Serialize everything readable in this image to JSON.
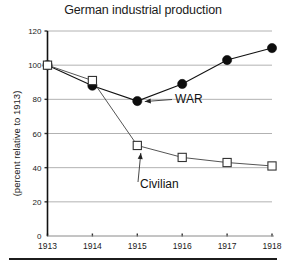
{
  "chart_data": {
    "type": "line",
    "title": "German industrial production",
    "xlabel": "",
    "ylabel": "(percent relative to 1913)",
    "categories": [
      "1913",
      "1914",
      "1915",
      "1916",
      "1917",
      "1918"
    ],
    "x": [
      1913,
      1914,
      1915,
      1916,
      1917,
      1918
    ],
    "xlim": [
      1913,
      1918
    ],
    "ylim": [
      0,
      120
    ],
    "yticks": [
      0,
      20,
      40,
      60,
      80,
      100,
      120
    ],
    "ytick_labels": [
      "0",
      "20",
      "40",
      "60",
      "80",
      "100",
      "120"
    ],
    "grid": true,
    "legend": "none",
    "series": [
      {
        "name": "WAR",
        "marker": "filled-circle",
        "values": [
          100,
          88,
          79,
          89,
          103,
          110
        ]
      },
      {
        "name": "Civilian",
        "marker": "open-square",
        "values": [
          100,
          91,
          53,
          46,
          43,
          41
        ]
      }
    ],
    "annotations": [
      {
        "text": "WAR",
        "points_to_year": 1915,
        "points_to_value": 79
      },
      {
        "text": "Civilian",
        "points_to_year": 1915,
        "points_to_value": 53
      }
    ],
    "colors": {
      "war_series": "#0d0d0d",
      "civilian_series": "#555555",
      "gridline": "#a9a9a9",
      "axis": "#111111",
      "background": "#ffffff"
    }
  }
}
